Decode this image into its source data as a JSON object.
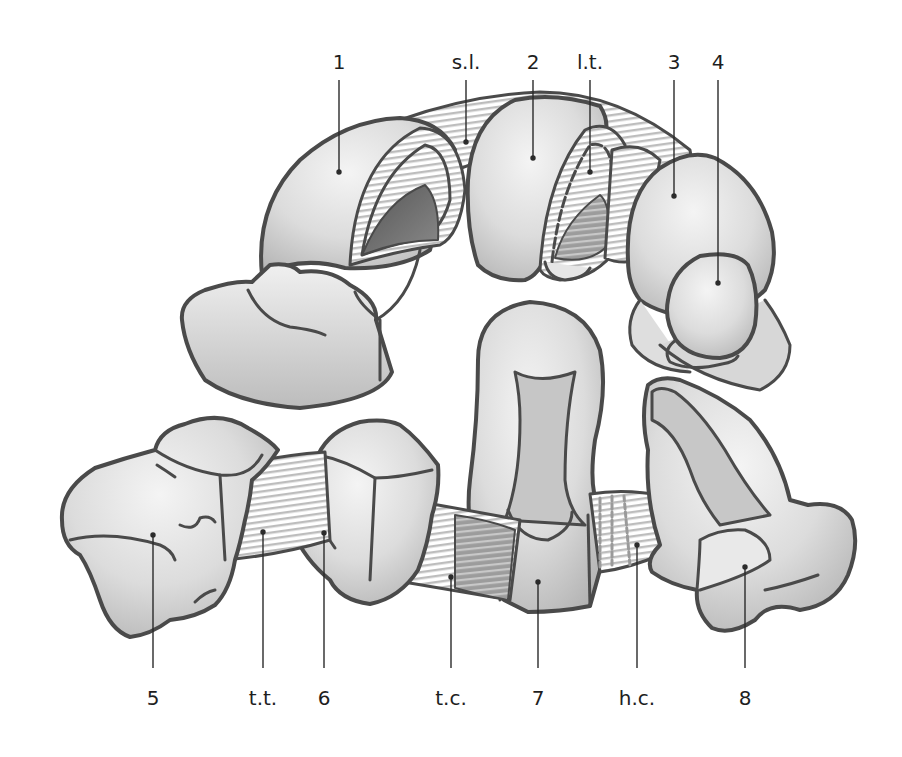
{
  "diagram": {
    "colors": {
      "background": "#ffffff",
      "outline": "#4a4a4a",
      "bone_light": "#ececec",
      "bone_mid": "#d2d2d2",
      "bone_shadow": "#a9a9a9",
      "bone_dark": "#6a6a6a",
      "ligament_stripe": "#bdbdbd",
      "leader_line": "#2a2a2a",
      "label_text": "#1e1e1e"
    },
    "top_labels": [
      {
        "id": "1",
        "text": "1",
        "x": 339,
        "point_y": 172
      },
      {
        "id": "s.l.",
        "text": "s.l.",
        "x": 466,
        "point_y": 142
      },
      {
        "id": "2",
        "text": "2",
        "x": 533,
        "point_y": 158
      },
      {
        "id": "l.t.",
        "text": "l.t.",
        "x": 590,
        "point_y": 172
      },
      {
        "id": "3",
        "text": "3",
        "x": 674,
        "point_y": 196
      },
      {
        "id": "4",
        "text": "4",
        "x": 718,
        "point_y": 283
      }
    ],
    "bottom_labels": [
      {
        "id": "5",
        "text": "5",
        "x": 153,
        "point_y": 535
      },
      {
        "id": "t.t.",
        "text": "t.t.",
        "x": 263,
        "point_y": 532
      },
      {
        "id": "6",
        "text": "6",
        "x": 324,
        "point_y": 533
      },
      {
        "id": "t.c.",
        "text": "t.c.",
        "x": 451,
        "point_y": 577
      },
      {
        "id": "7",
        "text": "7",
        "x": 538,
        "point_y": 582
      },
      {
        "id": "h.c.",
        "text": "h.c.",
        "x": 637,
        "point_y": 545
      },
      {
        "id": "8",
        "text": "8",
        "x": 745,
        "point_y": 567
      }
    ],
    "label_rows": {
      "top_text_y": 52,
      "top_line_start_y": 80,
      "bottom_text_y": 688,
      "bottom_line_end_y": 668
    }
  }
}
